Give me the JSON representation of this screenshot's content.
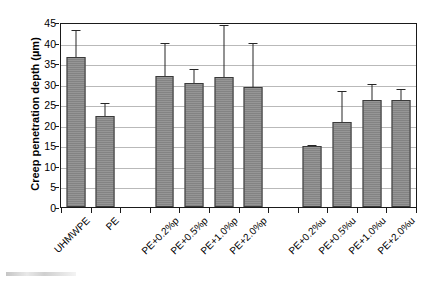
{
  "chart_data": {
    "type": "bar",
    "title": "",
    "xlabel": "",
    "ylabel": "Creep penetration depth (µm)",
    "ylim": [
      0,
      45
    ],
    "ytick_step": 5,
    "yticks": [
      0,
      5,
      10,
      15,
      20,
      25,
      30,
      35,
      40,
      45
    ],
    "ytick_labels": [
      "0",
      "5",
      "10",
      "15",
      "20",
      "25",
      "30",
      "35",
      "40",
      "45"
    ],
    "grid": true,
    "grid_axis": "y",
    "legend": false,
    "legend_position": "none",
    "bar_color": "#8a8a8a",
    "bar_edge_color": "#3a3a3a",
    "error_bar_color": "#262626",
    "categories": [
      "UHMWPE",
      "PE",
      "PE+0.2%p",
      "PE+0.5%p",
      "PE+1.0%p",
      "PE+2.0%p",
      "PE+0.2%u",
      "PE+0.5%u",
      "PE+1.0%u",
      "PE+2.0%u"
    ],
    "values": [
      37.0,
      22.4,
      32.3,
      30.4,
      32.0,
      29.4,
      15.0,
      21.0,
      26.2,
      26.2
    ],
    "errors": [
      6.5,
      3.1,
      8.0,
      3.6,
      12.7,
      11.0,
      0.2,
      7.6,
      4.0,
      2.7
    ],
    "error_upper": [
      43.5,
      25.5,
      40.3,
      34.0,
      44.7,
      40.4,
      15.2,
      28.6,
      30.2,
      28.9
    ],
    "slot_layout": [
      {
        "category": "UHMWPE",
        "slot": 0
      },
      {
        "category": "PE",
        "slot": 1
      },
      {
        "category": "",
        "slot": 2
      },
      {
        "category": "PE+0.2%p",
        "slot": 3
      },
      {
        "category": "PE+0.5%p",
        "slot": 4
      },
      {
        "category": "PE+1.0%p",
        "slot": 5
      },
      {
        "category": "PE+2.0%p",
        "slot": 6
      },
      {
        "category": "",
        "slot": 7
      },
      {
        "category": "PE+0.2%u",
        "slot": 8
      },
      {
        "category": "PE+0.5%u",
        "slot": 9
      },
      {
        "category": "PE+1.0%u",
        "slot": 10
      },
      {
        "category": "PE+2.0%u",
        "slot": 11
      }
    ]
  },
  "axis": {
    "y_title": "Creep penetration depth (µm)",
    "y_labels": [
      "45",
      "40",
      "35",
      "30",
      "25",
      "20",
      "15",
      "10",
      "5",
      "0"
    ],
    "x_labels": [
      "UHMWPE",
      "PE",
      "PE+0.2%p",
      "PE+0.5%p",
      "PE+1.0%p",
      "PE+2.0%p",
      "PE+0.2%u",
      "PE+0.5%u",
      "PE+1.0%u",
      "PE+2.0%u"
    ]
  }
}
